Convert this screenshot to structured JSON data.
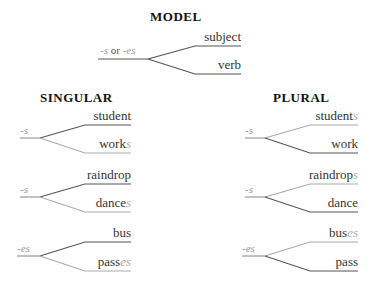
{
  "model": {
    "title": "MODEL",
    "ending_a": "-s",
    "ending_or": " or ",
    "ending_b": "-es",
    "top": "subject",
    "bottom": "verb"
  },
  "singular": {
    "title": "SINGULAR",
    "groups": [
      {
        "ending": "-s",
        "top_base": "student",
        "top_suffix": "",
        "bottom_base": "work",
        "bottom_suffix": "s"
      },
      {
        "ending": "-s",
        "top_base": "raindrop",
        "top_suffix": "",
        "bottom_base": "dance",
        "bottom_suffix": "s"
      },
      {
        "ending": "-es",
        "top_base": "bus",
        "top_suffix": "",
        "bottom_base": "pass",
        "bottom_suffix": "es"
      }
    ]
  },
  "plural": {
    "title": "PLURAL",
    "groups": [
      {
        "ending": "-s",
        "top_base": "student",
        "top_suffix": "s",
        "bottom_base": "work",
        "bottom_suffix": ""
      },
      {
        "ending": "-s",
        "top_base": "raindrop",
        "top_suffix": "s",
        "bottom_base": "dance",
        "bottom_suffix": ""
      },
      {
        "ending": "-es",
        "top_base": "bus",
        "top_suffix": "es",
        "bottom_base": "pass",
        "bottom_suffix": ""
      }
    ]
  },
  "colors": {
    "dark_line": "#555555",
    "light_line": "#b0b0b0",
    "suffix": "#aaaaaa"
  }
}
